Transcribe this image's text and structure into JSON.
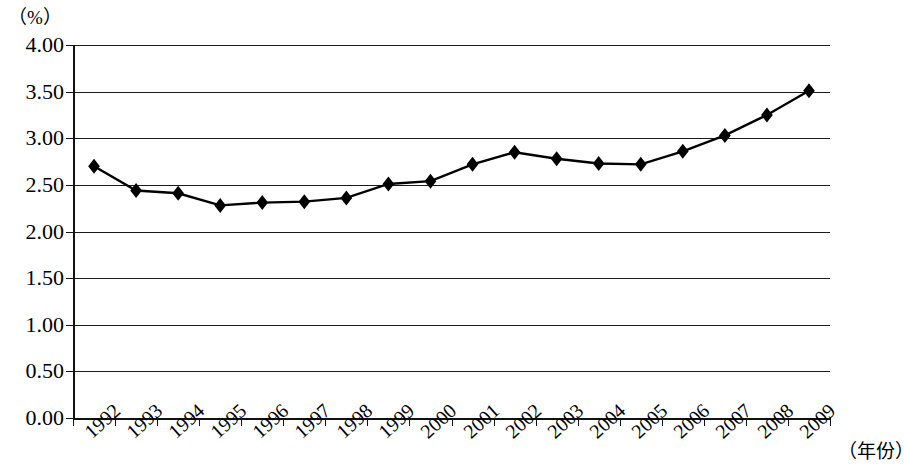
{
  "chart_data": {
    "type": "line",
    "title": "",
    "subtitle": "",
    "xlabel": "（年份）",
    "ylabel": "（%）",
    "categories": [
      "1992",
      "1993",
      "1994",
      "1995",
      "1996",
      "1997",
      "1998",
      "1999",
      "2000",
      "2001",
      "2002",
      "2003",
      "2004",
      "2005",
      "2006",
      "2007",
      "2008",
      "2009"
    ],
    "values": [
      2.7,
      2.44,
      2.41,
      2.28,
      2.31,
      2.32,
      2.36,
      2.51,
      2.54,
      2.72,
      2.85,
      2.78,
      2.73,
      2.72,
      2.86,
      3.03,
      3.25,
      3.51
    ],
    "series": [
      {
        "name": "",
        "values": [
          2.7,
          2.44,
          2.41,
          2.28,
          2.31,
          2.32,
          2.36,
          2.51,
          2.54,
          2.72,
          2.85,
          2.78,
          2.73,
          2.72,
          2.86,
          3.03,
          3.25,
          3.51
        ]
      }
    ],
    "ylim": [
      0.0,
      4.0
    ],
    "ytick_labels": [
      "4.00",
      "3.50",
      "3.00",
      "2.50",
      "2.00",
      "1.50",
      "1.00",
      "0.50",
      "0.00"
    ],
    "ytick_values": [
      4.0,
      3.5,
      3.0,
      2.5,
      2.0,
      1.5,
      1.0,
      0.5,
      0.0
    ],
    "grid": true,
    "legend": "none",
    "marker": "diamond",
    "line_color": "#000000",
    "marker_color": "#000000",
    "grid_color": "#1a1a1a",
    "background_color": "#ffffff"
  },
  "axes": {
    "unit_label": "（%）",
    "x_caption": "（年份）"
  }
}
